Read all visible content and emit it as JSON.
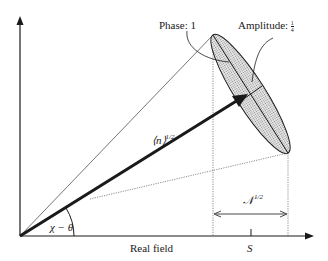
{
  "diagram": {
    "type": "phasor-diagram",
    "labels": {
      "phase": "Phase: 1",
      "amplitude_prefix": "Amplitude: ",
      "amplitude_num": "1",
      "amplitude_den": "4",
      "vector": "⟨n⟩",
      "vector_exp": "1/2",
      "angle": "χ − θ",
      "x_axis": "Real field",
      "tick": "S",
      "width_label": "𝒩",
      "width_exp": "1/2"
    },
    "colors": {
      "ink": "#1a1a1a",
      "ellipse_fill": "#c8c8c8"
    }
  }
}
